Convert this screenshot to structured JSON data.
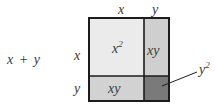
{
  "diagram": {
    "expression": "x + y",
    "top_labels": [
      "x",
      "y"
    ],
    "side_labels": [
      "x",
      "y"
    ],
    "regions": [
      {
        "id": "x2",
        "text": "x",
        "sup": "2",
        "color": "#ebebeb"
      },
      {
        "id": "xy_right",
        "text": "xy",
        "color": "#cfcfcf"
      },
      {
        "id": "xy_bottom",
        "text": "xy",
        "color": "#d2d2d2"
      },
      {
        "id": "y2",
        "color": "#7a7a7a"
      }
    ],
    "callout": {
      "text": "y",
      "sup": "2"
    },
    "border_color": "#1c1c1c"
  }
}
